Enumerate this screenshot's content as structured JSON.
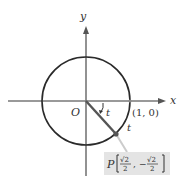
{
  "diagram": {
    "type": "unit-circle",
    "axes": {
      "x_label": "x",
      "y_label": "y",
      "origin_label": "O"
    },
    "point_on_axis": {
      "label": "(1, 0)"
    },
    "angle_label": "t",
    "arc_label": "t",
    "point": {
      "name": "P",
      "x_num": "√2",
      "x_den": "2",
      "y_sign": "−",
      "y_num": "√2",
      "y_den": "2",
      "comma": ","
    },
    "colors": {
      "axis": "#777777",
      "circle": "#2a2a2a",
      "radius": "#555555",
      "point": "#555555",
      "label_box": "#e4e4e4",
      "leader": "#cccccc"
    }
  }
}
